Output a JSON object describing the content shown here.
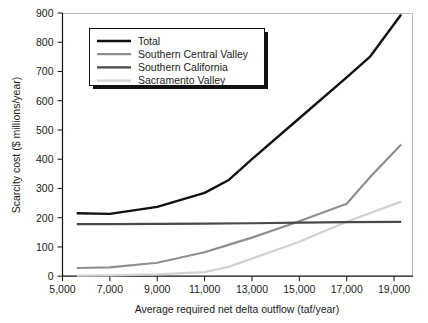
{
  "chart_data": {
    "type": "line",
    "title": "",
    "xlabel": "Average required net delta outflow (taf/year)",
    "ylabel": "Scarcity cost ($ millions/year)",
    "xlim": [
      5000,
      19800
    ],
    "ylim": [
      0,
      900
    ],
    "xticks": [
      5000,
      7000,
      9000,
      11000,
      13000,
      15000,
      17000,
      19000
    ],
    "xtick_labels": [
      "5,000",
      "7,000",
      "9,000",
      "11,000",
      "13,000",
      "15,000",
      "17,000",
      "19,000"
    ],
    "yticks": [
      0,
      100,
      200,
      300,
      400,
      500,
      600,
      700,
      800,
      900
    ],
    "ytick_labels": [
      "0",
      "100",
      "200",
      "300",
      "400",
      "500",
      "600",
      "700",
      "800",
      "900"
    ],
    "grid": false,
    "legend_position": "upper-left",
    "series": [
      {
        "name": "Total",
        "color": "#111111",
        "width": 2.4,
        "x": [
          5600,
          7000,
          9000,
          11000,
          12000,
          13000,
          15000,
          17000,
          18000,
          19300
        ],
        "values": [
          215,
          213,
          237,
          285,
          328,
          400,
          540,
          680,
          752,
          895
        ]
      },
      {
        "name": "Southern Central Valley",
        "color": "#8f8f8f",
        "width": 2.2,
        "x": [
          5600,
          7000,
          9000,
          11000,
          12000,
          13000,
          15000,
          17000,
          18000,
          19300
        ],
        "values": [
          28,
          30,
          46,
          82,
          107,
          132,
          188,
          248,
          340,
          450
        ]
      },
      {
        "name": "Southern California",
        "color": "#4a4a4a",
        "width": 2.2,
        "x": [
          5600,
          7000,
          9000,
          11000,
          13000,
          15000,
          17000,
          19300
        ],
        "values": [
          178,
          178,
          179,
          180,
          181,
          183,
          185,
          186
        ]
      },
      {
        "name": "Sacramento Valley",
        "color": "#d2d2d2",
        "width": 2.2,
        "x": [
          5600,
          7000,
          9000,
          11000,
          12000,
          13000,
          15000,
          17000,
          19300
        ],
        "values": [
          2,
          3,
          6,
          14,
          32,
          60,
          118,
          186,
          255
        ]
      }
    ]
  },
  "legend": {
    "items": [
      {
        "label": "Total"
      },
      {
        "label": "Southern Central Valley"
      },
      {
        "label": "Southern California"
      },
      {
        "label": "Sacramento Valley"
      }
    ]
  },
  "axes": {
    "x_title": "Average required net delta outflow (taf/year)",
    "y_title": "Scarcity cost ($ millions/year)"
  }
}
